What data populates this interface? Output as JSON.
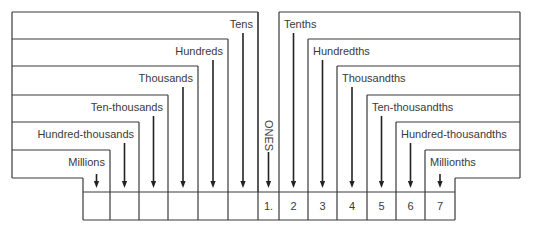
{
  "colors": {
    "line": "#3a3a3a",
    "text": "#3a3a3a",
    "background": "#ffffff"
  },
  "whole_places": [
    {
      "label": "Tens"
    },
    {
      "label": "Hundreds"
    },
    {
      "label": "Thousands"
    },
    {
      "label": "Ten-thousands"
    },
    {
      "label": "Hundred-thousands"
    },
    {
      "label": "Millions"
    }
  ],
  "ones": {
    "label": "ONES"
  },
  "decimal_places": [
    {
      "label": "Tenths"
    },
    {
      "label": "Hundredths"
    },
    {
      "label": "Thousandths"
    },
    {
      "label": "Ten-thousandths"
    },
    {
      "label": "Hundred-thousandths"
    },
    {
      "label": "Millionths"
    }
  ],
  "digit_row": {
    "cells": [
      "",
      "",
      "",
      "",
      "",
      "",
      "1.",
      "2",
      "3",
      "4",
      "5",
      "6",
      "7"
    ]
  }
}
